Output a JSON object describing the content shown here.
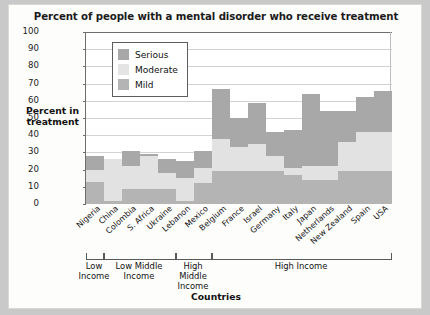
{
  "chart_data": {
    "type": "bar",
    "title": "Percent of people with a mental disorder who receive treatment",
    "xlabel": "Countries",
    "ylabel": "Percent in treatment",
    "ylim": [
      0,
      100
    ],
    "yticks": [
      0,
      10,
      20,
      30,
      40,
      50,
      60,
      70,
      80,
      90,
      100
    ],
    "grid": true,
    "stacked": true,
    "legend_position": "top-left",
    "legend": [
      "Serious",
      "Moderate",
      "Mild"
    ],
    "colors": {
      "serious": "#a8a8a8",
      "moderate": "#e2e2e2",
      "mild": "#b4b4b4"
    },
    "categories": [
      "Nigeria",
      "China",
      "Colombia",
      "S. Africa",
      "Ukraine",
      "Lebanon",
      "Mexico",
      "Belgium",
      "France",
      "Israel",
      "Germany",
      "Italy",
      "Japan",
      "Netherlands",
      "New Zealand",
      "Spain",
      "USA"
    ],
    "series": [
      {
        "name": "Mild",
        "values": [
          13,
          2,
          9,
          9,
          9,
          2,
          12,
          19,
          19,
          19,
          19,
          17,
          14,
          14,
          19,
          19,
          19
        ]
      },
      {
        "name": "Moderate",
        "values": [
          7,
          24,
          13,
          19,
          9,
          13,
          9,
          19,
          14,
          16,
          9,
          4,
          8,
          8,
          17,
          23,
          23
        ]
      },
      {
        "name": "Serious",
        "values": [
          8,
          0,
          9,
          1,
          8,
          10,
          10,
          29,
          17,
          24,
          14,
          22,
          42,
          32,
          18,
          20,
          24
        ]
      }
    ],
    "totals": [
      28,
      26,
      31,
      29,
      26,
      25,
      31,
      67,
      50,
      59,
      42,
      43,
      64,
      54,
      54,
      62,
      66
    ],
    "groups": [
      {
        "label": "Low Income",
        "start": 0,
        "end": 0
      },
      {
        "label": "Low Middle Income",
        "start": 1,
        "end": 4
      },
      {
        "label": "High Middle Income",
        "start": 5,
        "end": 6
      },
      {
        "label": "High Income",
        "start": 7,
        "end": 16
      }
    ]
  }
}
